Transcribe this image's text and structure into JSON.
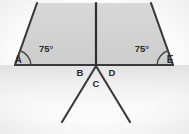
{
  "figure": {
    "type": "geometry-diagram",
    "background_color": "#fdfdfd",
    "shade_color": "#d4d4d4",
    "line_color": "#3a3a3a"
  },
  "vertices": {
    "A": {
      "label": "A",
      "x": 18,
      "y": 63,
      "marker": "arc"
    },
    "E": {
      "label": "E",
      "x": 170,
      "y": 63,
      "marker": "arc"
    },
    "B": {
      "label": "B",
      "x": 80,
      "y": 76
    },
    "C": {
      "label": "C",
      "x": 96,
      "y": 87
    },
    "D": {
      "label": "D",
      "x": 112,
      "y": 76
    }
  },
  "angles": [
    {
      "at": "A",
      "value": "75°",
      "label_x": 39,
      "label_y": 52
    },
    {
      "at": "E",
      "value": "75°",
      "label_x": 149,
      "label_y": 52
    }
  ],
  "geometry": {
    "baseline": {
      "x1": 15,
      "y1": 65,
      "x2": 173,
      "y2": 65
    },
    "left_slant": {
      "x1": 15,
      "y1": 65,
      "x2": 37,
      "y2": 3
    },
    "right_slant": {
      "x1": 173,
      "y1": 65,
      "x2": 151,
      "y2": 3
    },
    "vertical": {
      "x1": 96,
      "y1": 3,
      "x2": 96,
      "y2": 66
    },
    "ray_left": {
      "x1": 96,
      "y1": 66,
      "x2": 62,
      "y2": 122
    },
    "ray_right": {
      "x1": 96,
      "y1": 66,
      "x2": 130,
      "y2": 122
    },
    "shaded_polygon": "15,65 37,3 151,3 173,65"
  }
}
